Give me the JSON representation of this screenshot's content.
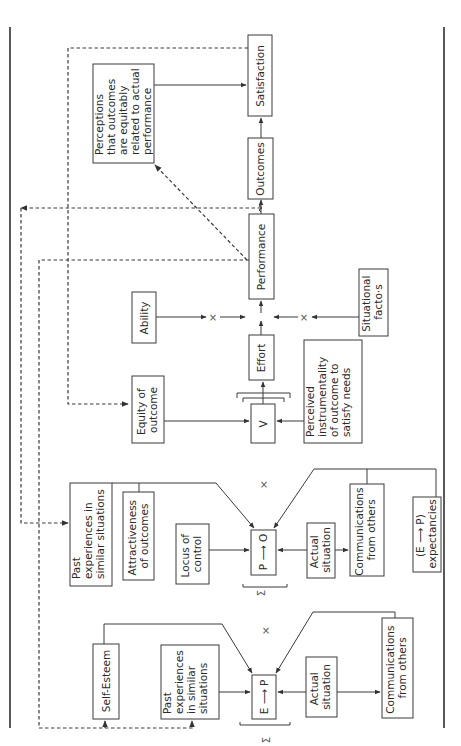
{
  "diagram": {
    "type": "flow-model",
    "orientation": "rotated-90",
    "boxes": {
      "satisfaction": "Satisfaction",
      "perceptions_equity": [
        "Perceptions",
        "that outcomes",
        "are equitably",
        "related to actual",
        "performance"
      ],
      "outcomes": "Outcomes",
      "performance": "Performance",
      "ability": "Ability",
      "situational_factors": [
        "Situational",
        "facto·s"
      ],
      "effort": "Effort",
      "equity_of_outcome": [
        "Equity of",
        "outcome"
      ],
      "valence": "V",
      "perceived_instrumentality": [
        "Perceived",
        "instrumentality",
        "of outcome to",
        "satisfy needs"
      ],
      "past_exp_po": [
        "Past",
        "experiences in",
        "similar situations"
      ],
      "attractiveness": [
        "Attractiveness",
        "of outcomes"
      ],
      "locus_of_control": [
        "Locus of",
        "control"
      ],
      "p_to_o": "P ⟶ O",
      "actual_situation_po": [
        "Actual",
        "situation"
      ],
      "communications_po": [
        "Communications",
        "from others"
      ],
      "ep_expectancies": [
        "(E ⟶ P)",
        "expectancies"
      ],
      "self_esteem": "Self-Esteem",
      "past_exp_ep": [
        "Past",
        "experiences",
        "in similar",
        "situations"
      ],
      "e_to_p": "E ⟶ P",
      "actual_situation_ep": [
        "Actual",
        "situation"
      ],
      "communications_ep": [
        "Communications",
        "from others"
      ]
    },
    "symbols": {
      "multiply": "×",
      "sum": "Σ"
    }
  }
}
